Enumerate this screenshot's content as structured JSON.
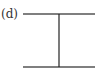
{
  "diagram": {
    "label": "(d)",
    "line_color": "#555555",
    "vertical_color": "#222222",
    "shapes": [
      {
        "type": "horizontal-line",
        "x1": 23,
        "x2": 95,
        "y": 14
      },
      {
        "type": "horizontal-line",
        "x1": 23,
        "x2": 95,
        "y": 67
      },
      {
        "type": "vertical-line",
        "x": 59,
        "y1": 14,
        "y2": 67
      }
    ]
  }
}
